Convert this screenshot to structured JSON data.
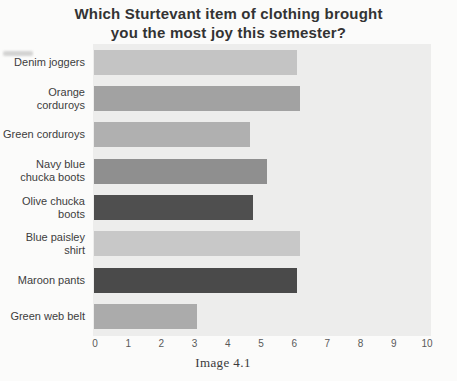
{
  "chart": {
    "title": "Which Sturtevant item of clothing brought you the most joy this semester?",
    "title_display": "Which Sturtevant item of clothing brought\nyou the most joy this semester?",
    "caption": "Image 4.1"
  },
  "chart_data": {
    "type": "bar",
    "orientation": "horizontal",
    "title": "Which Sturtevant item of clothing brought you the most joy this semester?",
    "caption": "Image 4.1",
    "xlabel": "",
    "ylabel": "",
    "xlim": [
      0,
      10
    ],
    "x_ticks": [
      0,
      1,
      2,
      3,
      4,
      5,
      6,
      7,
      8,
      9,
      10
    ],
    "grid": false,
    "legend": false,
    "categories": [
      "Denim joggers",
      "Orange corduroys",
      "Green corduroys",
      "Navy blue chucka boots",
      "Olive chucka boots",
      "Blue paisley shirt",
      "Maroon pants",
      "Green web belt"
    ],
    "category_display": [
      "Denim joggers",
      "Orange\ncorduroys",
      "Green corduroys",
      "Navy blue\nchucka boots",
      "Olive chucka\nboots",
      "Blue paisley\nshirt",
      "Maroon pants",
      "Green web belt"
    ],
    "values": [
      6.1,
      6.2,
      4.7,
      5.2,
      4.8,
      6.2,
      6.1,
      3.1
    ],
    "bar_colors": [
      "#c4c4c4",
      "#a2a2a2",
      "#b0b0b0",
      "#8f8f8f",
      "#4f4f4f",
      "#c8c8c8",
      "#4a4a4a",
      "#ababab"
    ],
    "plot_background": "#ededec"
  }
}
